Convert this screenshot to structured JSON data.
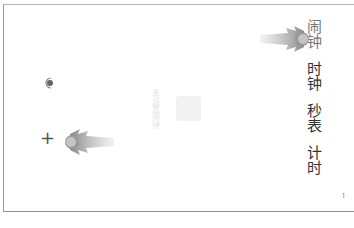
{
  "app": {
    "orientation": "rotated-90-clockwise",
    "tabs": [
      {
        "label": "闹钟",
        "active": true
      },
      {
        "label": "时钟",
        "active": false
      },
      {
        "label": "秒表",
        "active": false
      },
      {
        "label": "计时",
        "active": false
      }
    ],
    "more_menu_label": "...",
    "empty_state": {
      "text": "未设置闹钟",
      "icon": "alarm-empty-icon"
    },
    "buttons": {
      "add_label": "+",
      "voice_icon": "microphone-icon"
    },
    "gestures": [
      {
        "name": "swipe-gesture-top",
        "icon": "swipe-indicator-icon"
      },
      {
        "name": "swipe-gesture-bottom",
        "icon": "swipe-indicator-icon"
      }
    ],
    "colors": {
      "background": "#ffffff",
      "tab_text": "#333333",
      "tab_active": "#777777",
      "gesture": "#999999"
    }
  }
}
